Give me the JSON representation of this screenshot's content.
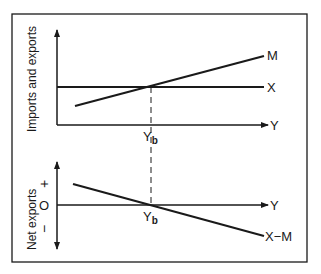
{
  "diagram": {
    "top_panel": {
      "y_axis_label": "Imports and exports",
      "x_axis_label": "Y",
      "lines": [
        {
          "name": "M",
          "label": "M",
          "description": "Imports, upward sloping"
        },
        {
          "name": "X",
          "label": "X",
          "description": "Exports, horizontal"
        }
      ],
      "intersection_label": "Y",
      "intersection_subscript": "b"
    },
    "bottom_panel": {
      "y_axis_label": "Net exports",
      "x_axis_label": "Y",
      "plus_label": "+",
      "zero_label": "O",
      "minus_label": "−",
      "lines": [
        {
          "name": "X-M",
          "label": "X−M",
          "description": "Net exports, downward sloping"
        }
      ],
      "intersection_label": "Y",
      "intersection_subscript": "b"
    },
    "colors": {
      "ink": "#1a1a1a",
      "background": "#ffffff"
    }
  }
}
